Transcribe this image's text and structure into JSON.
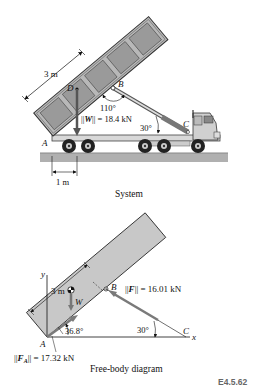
{
  "system": {
    "caption": "System",
    "labels": {
      "D": "D",
      "B": "B",
      "C": "C",
      "A": "A",
      "bed_length": "3 m",
      "offset": "1 m",
      "angle_bed": "110°",
      "angle_strut": "30°",
      "weight_prefix": "||",
      "weight_symbol": "W",
      "weight_suffix": "|| = 18.4 kN"
    },
    "colors": {
      "bed_fill": "#b3b3b3",
      "bed_panel": "#9a9a9a",
      "frame": "#444444",
      "ground": "#a8a8a8",
      "tire": "#222222"
    }
  },
  "fbd": {
    "caption": "Free-body diagram",
    "labels": {
      "y_axis": "y",
      "x_axis": "x",
      "A": "A",
      "B": "B",
      "C": "C",
      "bed_length": "3 m",
      "weight_symbol": "W",
      "angle_A": "36.8°",
      "angle_C": "30°",
      "force_F_prefix": "||",
      "force_F_symbol": "F",
      "force_F_suffix": "|| = 16.01 kN",
      "force_FA_prefix": "||",
      "force_FA_symbol": "F",
      "force_FA_sub": "A",
      "force_FA_suffix": "|| = 17.32 kN"
    },
    "colors": {
      "bed_fill": "#c8c8c8",
      "force_arrow": "#7a7a7a"
    }
  },
  "figure_tag": "E4.5.62"
}
